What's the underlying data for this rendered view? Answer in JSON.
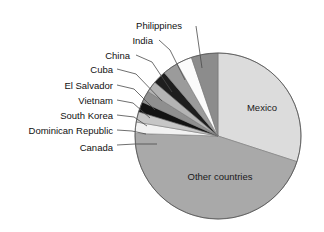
{
  "chart_data": {
    "type": "pie",
    "title": "",
    "subtitle": "",
    "xlabel": "",
    "ylabel": "",
    "legend_position": "callout-labels",
    "grid": false,
    "categories": [
      "Mexico",
      "Other countries",
      "Canada",
      "Dominican Republic",
      "South Korea",
      "Vietnam",
      "El Salvador",
      "Cuba",
      "China",
      "India",
      "Philippines"
    ],
    "values": [
      30.0,
      45.5,
      2.2,
      2.0,
      2.0,
      2.3,
      2.2,
      2.6,
      3.0,
      3.0,
      5.2
    ],
    "slices": [
      {
        "label": "Mexico",
        "value": 30.0,
        "color": "#dcdcdc",
        "label_inside": true,
        "label_x": 262,
        "label_y": 108
      },
      {
        "label": "Other countries",
        "value": 45.5,
        "color": "#a9a9a9",
        "label_inside": true,
        "label_x": 220,
        "label_y": 177
      },
      {
        "label": "Canada",
        "value": 2.2,
        "color": "#f2f2f2",
        "label_inside": false,
        "label_x": 113,
        "label_y": 148,
        "leader": "157,144 135,144 117,145"
      },
      {
        "label": "Dominican Republic",
        "value": 2.0,
        "color": "#c6c6c6",
        "label_inside": false,
        "label_x": 113,
        "label_y": 131,
        "leader": "146,134 132,131 117,130"
      },
      {
        "label": "South Korea",
        "value": 2.0,
        "color": "#121212",
        "label_inside": false,
        "label_x": 113,
        "label_y": 116,
        "leader": "147,126 134,117 117,115"
      },
      {
        "label": "Vietnam",
        "value": 2.3,
        "color": "#8f8f8f",
        "label_inside": false,
        "label_x": 113,
        "label_y": 101,
        "leader": "150,118 133,103 117,100"
      },
      {
        "label": "El Salvador",
        "value": 2.2,
        "color": "#b4b4b4",
        "label_inside": false,
        "label_x": 113,
        "label_y": 86,
        "leader": "155,110 134,89 117,85"
      },
      {
        "label": "Cuba",
        "value": 2.6,
        "color": "#1e1e1e",
        "label_inside": false,
        "label_x": 113,
        "label_y": 70,
        "leader": "162,101 136,74 117,69"
      },
      {
        "label": "China",
        "value": 3.0,
        "color": "#9b9b9b",
        "label_inside": false,
        "label_x": 130,
        "label_y": 56,
        "leader": "172,92 152,62 136,55"
      },
      {
        "label": "India",
        "value": 3.0,
        "color": "#fbfbfb",
        "label_inside": false,
        "label_x": 153,
        "label_y": 41,
        "leader": "185,80 170,50 159,40"
      },
      {
        "label": "Philippines",
        "value": 5.2,
        "color": "#8c8c8c",
        "label_inside": false,
        "label_x": 182,
        "label_y": 26,
        "leader": "202,68 198,40 196,26"
      }
    ],
    "geometry": {
      "cx": 218,
      "cy": 136,
      "r": 83,
      "start_angle_deg": 0,
      "direction": "clockwise"
    }
  }
}
